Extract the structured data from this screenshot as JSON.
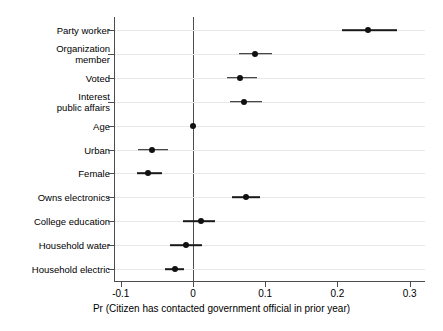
{
  "chart_data": {
    "type": "scatter",
    "title": "",
    "subtitle": "",
    "xlabel": "Pr (Citizen has contacted government official in prior year)",
    "ylabel": "",
    "xlim": [
      -0.115,
      0.322
    ],
    "xticks": [
      -0.1,
      0,
      0.1,
      0.2,
      0.3
    ],
    "xticklabels": [
      "-0.1",
      "0",
      "0.1",
      "0.2",
      "0.3"
    ],
    "grid": "horizontal",
    "legend": "none",
    "reference_line": 0,
    "categories": [
      "Party worker",
      "Organization\nmember",
      "Voted",
      "Interest\npublic affairs",
      "Age",
      "Urban",
      "Female",
      "Owns electronics",
      "College education",
      "Household water",
      "Household electric"
    ],
    "series": [
      {
        "name": "Marginal effect",
        "values": [
          0.243,
          0.086,
          0.065,
          0.071,
          0.0,
          -0.057,
          -0.063,
          0.073,
          0.011,
          -0.01,
          -0.025
        ],
        "ci_low": [
          0.206,
          0.064,
          0.047,
          0.051,
          0.0,
          -0.076,
          -0.078,
          0.054,
          -0.014,
          -0.032,
          -0.039
        ],
        "ci_high": [
          0.282,
          0.11,
          0.088,
          0.096,
          0.0,
          -0.035,
          -0.043,
          0.093,
          0.031,
          0.013,
          -0.012
        ]
      }
    ]
  },
  "colors": {
    "point": "#111111",
    "line": "#1a1a1a",
    "axis": "#4d4d4d",
    "grid": "#e8e8e8",
    "background": "#ffffff"
  }
}
